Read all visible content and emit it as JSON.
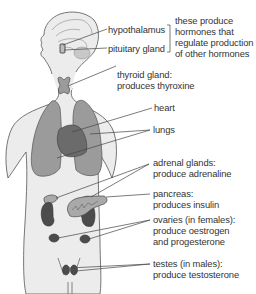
{
  "figure": {
    "colors": {
      "body_fill": "#ececec",
      "outline": "#555555",
      "lungs": "#9b9b9b",
      "heart": "#6b6b6b",
      "kidneys": "#4c4c4c",
      "gland_light": "#a9a9a9",
      "leader_line": "#444444"
    }
  },
  "labels": {
    "hypothalamus": "hypothalamus",
    "pituitary": "pituitary gland",
    "brain_note": [
      "these produce",
      "hormones that",
      "regulate production",
      "of other hormones"
    ],
    "thyroid": [
      "thyroid gland:",
      "produces thyroxine"
    ],
    "heart": "heart",
    "lungs": "lungs",
    "adrenal": [
      "adrenal glands:",
      "produce adrenaline"
    ],
    "pancreas": [
      "pancreas:",
      "produces insulin"
    ],
    "ovaries": [
      "ovaries (in females):",
      "produce oestrogen",
      "and progesterone"
    ],
    "testes": [
      "testes (in males):",
      "produce testosterone"
    ]
  }
}
